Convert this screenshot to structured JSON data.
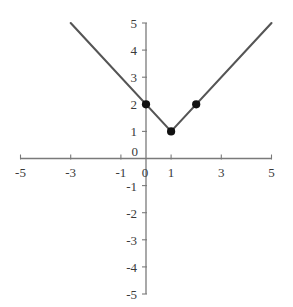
{
  "chart_data": {
    "type": "line",
    "title": "",
    "subtitle": "",
    "xlabel": "",
    "ylabel": "",
    "xlim": [
      -5,
      5
    ],
    "ylim": [
      -5,
      5
    ],
    "grid": false,
    "legend": null,
    "axis_color": "#7a7a7a",
    "line_color": "#555555",
    "point_color": "#111111",
    "equation": "y = |x - 1| + 1",
    "x_ticks": [
      -5,
      -4,
      -3,
      -2,
      -1,
      0,
      1,
      2,
      3,
      4,
      5
    ],
    "x_tick_labels": [
      "-5",
      "",
      "-3",
      "",
      "-1",
      "0",
      "1",
      "",
      "3",
      "",
      "5"
    ],
    "y_ticks": [
      -5,
      -4,
      -3,
      -2,
      -1,
      0,
      1,
      2,
      3,
      4,
      5
    ],
    "y_tick_labels": [
      "-5",
      "-4",
      "-3",
      "-2",
      "-1",
      "0",
      "1",
      "2",
      "3",
      "4",
      "5"
    ],
    "series": [
      {
        "name": "absolute-value-function",
        "type": "line",
        "x": [
          -3,
          1,
          5
        ],
        "y": [
          5,
          1,
          5
        ]
      }
    ],
    "points": [
      {
        "x": 0,
        "y": 2,
        "label": "(0, 2)"
      },
      {
        "x": 1,
        "y": 1,
        "label": "(1, 1)"
      },
      {
        "x": 2,
        "y": 2,
        "label": "(2, 2)"
      }
    ]
  }
}
